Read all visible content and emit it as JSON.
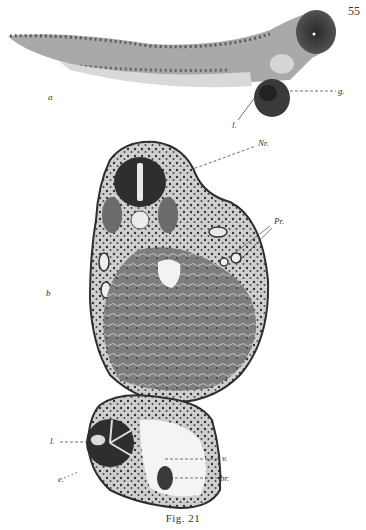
{
  "page": {
    "number": "55",
    "caption": "Fig. 21"
  },
  "figure_a": {
    "panel_label": "a",
    "subject": "embryo-whole-mount",
    "labels": {
      "g": "g.",
      "l": "l."
    }
  },
  "figure_b": {
    "panel_label": "b",
    "subject": "transverse-section",
    "labels": {
      "Nr": "Nr.",
      "Pr": "Pr.",
      "l": "l.",
      "e": "e.",
      "v": "v.",
      "br": "br."
    }
  },
  "colors": {
    "background": "#ffffff",
    "ink": "#2a2a2a",
    "tissue_dark": "#2e2e2e",
    "tissue_mid": "#7a7a7a",
    "tissue_light": "#b9b9b9"
  }
}
